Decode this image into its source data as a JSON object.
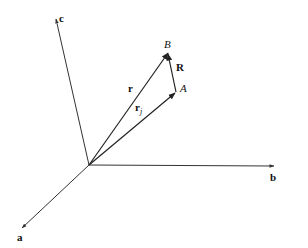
{
  "diagram": {
    "type": "vector-diagram",
    "origin": {
      "x": 89,
      "y": 165
    },
    "axes": [
      {
        "name": "a",
        "label": "a",
        "tip": {
          "x": 22,
          "y": 228
        }
      },
      {
        "name": "b",
        "label": "b",
        "tip": {
          "x": 273,
          "y": 167
        }
      },
      {
        "name": "c",
        "label": "c",
        "tip": {
          "x": 56,
          "y": 18
        }
      }
    ],
    "points": [
      {
        "name": "A",
        "label": "A",
        "x": 176,
        "y": 92
      },
      {
        "name": "B",
        "label": "B",
        "x": 168,
        "y": 52
      }
    ],
    "vectors": [
      {
        "name": "r",
        "label": "r",
        "from": "origin",
        "to": "B"
      },
      {
        "name": "r_j",
        "label": "r",
        "subscript": "j",
        "from": "origin",
        "to": "A"
      },
      {
        "name": "R",
        "label": "R",
        "from": "A",
        "to": "B"
      }
    ],
    "labels": {
      "axis_a": "a",
      "axis_b": "b",
      "axis_c": "c",
      "point_A": "A",
      "point_B": "B",
      "vector_r": "r",
      "vector_rj_main": "r",
      "vector_rj_sub": "j",
      "vector_R": "R"
    },
    "colors": {
      "line": "#333333",
      "text": "#111111",
      "background": "#ffffff"
    }
  }
}
